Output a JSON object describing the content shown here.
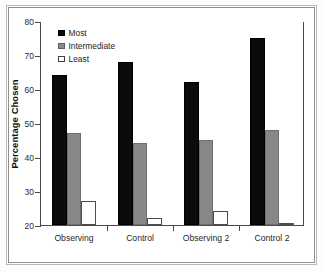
{
  "chart_data": {
    "type": "bar",
    "title": "",
    "xlabel": "",
    "ylabel": "Percentage Chosen",
    "categories": [
      "Observing",
      "Control",
      "Observing 2",
      "Control 2"
    ],
    "series": [
      {
        "name": "Most",
        "color": "#0b0b0b",
        "values": [
          64,
          68,
          62,
          75
        ]
      },
      {
        "name": "Intermediate",
        "color": "#878787",
        "values": [
          47,
          44,
          45,
          48
        ]
      },
      {
        "name": "Least",
        "color": "#ffffff",
        "values": [
          27,
          22,
          24,
          16
        ]
      }
    ],
    "ylim": [
      20,
      80
    ],
    "yticks": [
      20,
      30,
      40,
      50,
      60,
      70,
      80
    ],
    "ytick_labels": [
      "20",
      "30",
      "40",
      "50",
      "60",
      "70",
      "80"
    ],
    "grid": false,
    "legend_position": "top-left",
    "legend_entries": [
      "Most",
      "Intermediate",
      "Least"
    ]
  }
}
